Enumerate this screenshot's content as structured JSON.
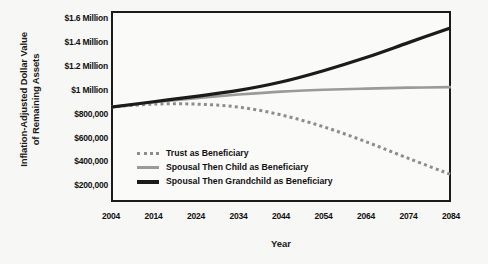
{
  "chart_data": {
    "type": "line",
    "title": "",
    "xlabel": "Year",
    "ylabel": "Inflation-Adjusted Dollar Value of Remaining Assets",
    "ylabel_line1": "Inflation-Adjusted Dollar Value",
    "ylabel_line2": "of Remaining Assets",
    "x": [
      2004,
      2014,
      2024,
      2034,
      2044,
      2054,
      2064,
      2074,
      2084
    ],
    "xtick_labels": [
      "2004",
      "2014",
      "2024",
      "2034",
      "2044",
      "2054",
      "2064",
      "2074",
      "2084"
    ],
    "ytick_labels": [
      "$1.6 Million",
      "$1.4 Million",
      "$1.2 Million",
      "$1 Million",
      "$800,000",
      "$600,000",
      "$400,000",
      "$200,000"
    ],
    "ytick_values": [
      1600000,
      1400000,
      1200000,
      1000000,
      800000,
      600000,
      400000,
      200000
    ],
    "xlim": [
      2004,
      2084
    ],
    "ylim": [
      60000,
      1660000
    ],
    "grid": false,
    "legend_position": "inside-lower-left",
    "series": [
      {
        "name": "Trust as Beneficiary",
        "style": "dotted",
        "color": "#8d8d8d",
        "values": [
          855000,
          880000,
          880000,
          855000,
          790000,
          690000,
          565000,
          425000,
          290000
        ]
      },
      {
        "name": "Spousal Then Child as Beneficiary",
        "style": "solid",
        "color": "#9a9a9a",
        "values": [
          855000,
          895000,
          930000,
          960000,
          985000,
          1000000,
          1010000,
          1018000,
          1022000
        ]
      },
      {
        "name": "Spousal Then Grandchild as Beneficiary",
        "style": "solid",
        "color": "#1b1b1b",
        "values": [
          855000,
          900000,
          945000,
          995000,
          1065000,
          1160000,
          1270000,
          1395000,
          1520000
        ]
      }
    ]
  }
}
